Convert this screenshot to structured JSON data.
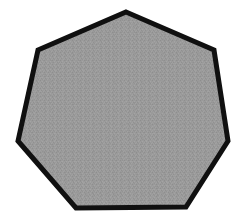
{
  "canvas": {
    "width": 237,
    "height": 220,
    "background_color": "#ffffff",
    "label": "heptagon-figure"
  },
  "shape": {
    "name": "heptagon",
    "sides": 7,
    "fill_color": "#989898",
    "fill_texture": "dithered-noise",
    "stroke_color": "#101010",
    "stroke_width": 5,
    "points": "126,12 214,50 228,141 186,207 76,208 18,141 38,50",
    "vertices": [
      {
        "id": "top",
        "x": 126,
        "y": 12
      },
      {
        "id": "upper-right",
        "x": 214,
        "y": 50
      },
      {
        "id": "right",
        "x": 228,
        "y": 141
      },
      {
        "id": "lower-right",
        "x": 186,
        "y": 207
      },
      {
        "id": "lower-left",
        "x": 76,
        "y": 208
      },
      {
        "id": "left",
        "x": 18,
        "y": 141
      },
      {
        "id": "upper-left",
        "x": 38,
        "y": 50
      }
    ]
  }
}
